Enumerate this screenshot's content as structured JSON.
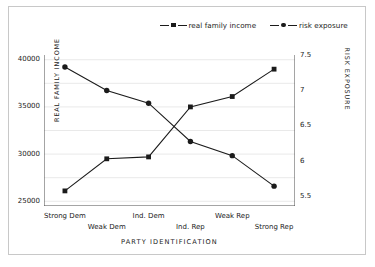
{
  "chart_data": {
    "type": "line",
    "title": "",
    "xlabel": "PARTY IDENTIFICATION",
    "categories": [
      "Strong Dem",
      "Weak Dem",
      "Ind. Dem",
      "Ind. Rep",
      "Weak Rep",
      "Strong Rep"
    ],
    "grid": true,
    "legend_position": "top-center",
    "axes": {
      "left": {
        "label": "REAL FAMILY INCOME",
        "ticks": [
          "25000",
          "30000",
          "35000",
          "40000"
        ],
        "tick_values": [
          25000,
          30000,
          35000,
          40000
        ],
        "ylim": [
          24500,
          40500
        ]
      },
      "right": {
        "label": "RISK EXPOSURE",
        "ticks": [
          "5.5",
          "6",
          "6.5",
          "7",
          "7.5"
        ],
        "tick_values": [
          5.5,
          6.0,
          6.5,
          7.0,
          7.5
        ],
        "ylim": [
          5.37,
          7.5
        ]
      }
    },
    "series": [
      {
        "name": "real family income",
        "axis": "left",
        "marker": "square",
        "color": "#1b1b1b",
        "values": [
          26100,
          29500,
          29700,
          35000,
          36100,
          39000
        ]
      },
      {
        "name": "risk exposure",
        "axis": "right",
        "marker": "circle",
        "color": "#1b1b1b",
        "values": [
          7.33,
          7.0,
          6.82,
          6.28,
          6.08,
          5.65
        ]
      }
    ]
  },
  "legend": {
    "entries": [
      {
        "label": "real family income",
        "marker": "square-marker-icon"
      },
      {
        "label": "risk exposure",
        "marker": "circle-marker-icon"
      }
    ]
  },
  "style": {
    "axis_color": "#4a4a4a",
    "grid_color": "#e9e9e9",
    "frame_color": "#c8c8c8",
    "series_color": "#1b1b1b",
    "background": "#ffffff"
  }
}
